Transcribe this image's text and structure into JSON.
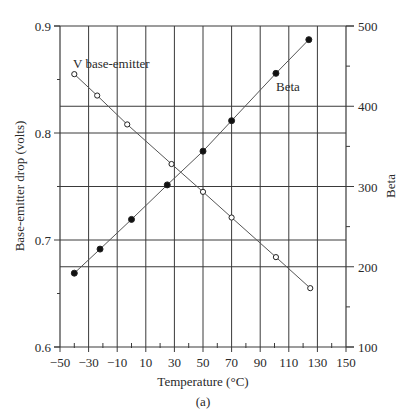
{
  "chart_data": {
    "type": "line",
    "title": "",
    "caption": "(a)",
    "xlabel": "Temperature (°C)",
    "ylabel_left": "Base-emitter drop (volts)",
    "ylabel_right": "Beta",
    "xlim": [
      -50,
      150
    ],
    "ylim_left": [
      0.6,
      0.9
    ],
    "ylim_right": [
      100,
      500
    ],
    "x_ticks": [
      -50,
      -30,
      -10,
      10,
      30,
      50,
      70,
      90,
      110,
      130,
      150
    ],
    "x_tick_labels": [
      "−50",
      "−30",
      "−10",
      "10",
      "30",
      "50",
      "70",
      "90",
      "110",
      "130",
      "150"
    ],
    "y_left_ticks": [
      0.6,
      0.7,
      0.8,
      0.9
    ],
    "y_left_tick_labels": [
      "0.6",
      "0.7",
      "0.8",
      "0.9"
    ],
    "y_right_ticks": [
      100,
      200,
      300,
      400,
      500
    ],
    "y_right_tick_labels": [
      "100",
      "200",
      "300",
      "400",
      "500"
    ],
    "grid": true,
    "series": [
      {
        "name": "V base-emitter",
        "axis": "left",
        "marker": "open-circle",
        "x": [
          -40,
          -24,
          -3,
          28,
          50,
          70,
          101,
          125
        ],
        "values": [
          0.855,
          0.835,
          0.808,
          0.771,
          0.745,
          0.721,
          0.684,
          0.655
        ]
      },
      {
        "name": "Beta",
        "axis": "right",
        "marker": "filled-circle",
        "x": [
          -40,
          -22,
          0,
          25,
          50,
          70,
          101,
          124
        ],
        "values": [
          192,
          222,
          259,
          302,
          344,
          382,
          441,
          483
        ]
      }
    ],
    "annotations": [
      {
        "text": "V base-emitter",
        "near_series": "V base-emitter"
      },
      {
        "text": "Beta",
        "near_series": "Beta"
      }
    ]
  }
}
